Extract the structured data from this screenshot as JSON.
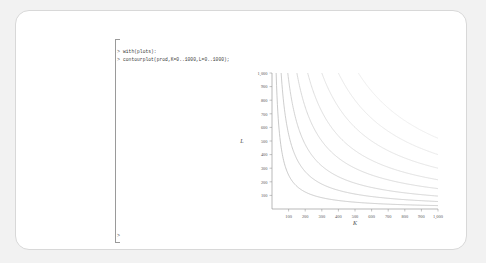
{
  "app": {
    "name": "maple-worksheet"
  },
  "worksheet": {
    "prompt_symbol": ">",
    "lines": [
      {
        "prompt": ">",
        "text": "with(plots):"
      },
      {
        "prompt": ">",
        "text": "contourplot(prod,K=0..1000,L=0..1000);"
      }
    ],
    "trailing_prompt": ">"
  },
  "colors": {
    "page_background": "#f2f2f2",
    "card_background": "#ffffff",
    "card_border": "#d8d8d8",
    "bracket": "#9a9a9a",
    "text": "#3a3a3a",
    "axis": "#8a8a8a",
    "tick_label": "#595959"
  },
  "chart_data": {
    "type": "line",
    "title": "",
    "xlabel": "K",
    "ylabel": "L",
    "xlim": [
      0,
      1000
    ],
    "ylim": [
      0,
      1000
    ],
    "grid": false,
    "legend": "none",
    "xticks": [
      100,
      200,
      300,
      400,
      500,
      600,
      700,
      800,
      900,
      1000
    ],
    "xticklabels": [
      "100",
      "200",
      "300",
      "400",
      "500",
      "600",
      "700",
      "800",
      "900",
      "1,000"
    ],
    "yticks": [
      100,
      200,
      300,
      400,
      500,
      600,
      700,
      800,
      900,
      1000
    ],
    "yticklabels": [
      "100",
      "200",
      "300",
      "400",
      "500",
      "600",
      "700",
      "800",
      "900",
      "1,000"
    ],
    "contour_levels": [
      8,
      7,
      6,
      5,
      4,
      3,
      2,
      1
    ],
    "series": [
      {
        "name": "level-1",
        "shade": "#bdbdbd",
        "k_at_L1000": 25,
        "curve_constant": 25000
      },
      {
        "name": "level-2",
        "shade": "#c2c2c2",
        "k_at_L1000": 55,
        "curve_constant": 55000
      },
      {
        "name": "level-3",
        "shade": "#c8c8c8",
        "k_at_L1000": 95,
        "curve_constant": 95000
      },
      {
        "name": "level-4",
        "shade": "#cfcfcf",
        "k_at_L1000": 150,
        "curve_constant": 150000
      },
      {
        "name": "level-5",
        "shade": "#d5d5d5",
        "k_at_L1000": 215,
        "curve_constant": 215000
      },
      {
        "name": "level-6",
        "shade": "#dcdcdc",
        "k_at_L1000": 300,
        "curve_constant": 300000
      },
      {
        "name": "level-7",
        "shade": "#e2e2e2",
        "k_at_L1000": 400,
        "curve_constant": 400000
      },
      {
        "name": "level-8",
        "shade": "#e8e8e8",
        "k_at_L1000": 520,
        "curve_constant": 520000
      }
    ]
  }
}
